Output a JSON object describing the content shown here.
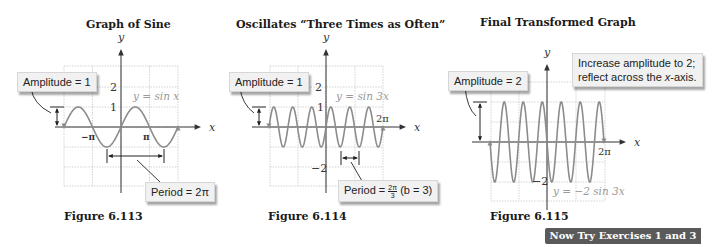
{
  "panels": [
    {
      "title": "Graph of Sine",
      "figure": "Figure 6.113",
      "equation": "y = sin x",
      "callouts": {
        "amplitude": "Amplitude = 1",
        "period_prefix": "Period = 2π"
      },
      "ticks": {
        "y_top": "2",
        "y_one": "1",
        "neg_pi": "−π",
        "pi": "π"
      },
      "axis": {
        "x": "x",
        "y": "y"
      }
    },
    {
      "title": "Oscillates “Three Times as Often”",
      "figure": "Figure 6.114",
      "equation": "y = sin 3x",
      "callouts": {
        "amplitude": "Amplitude = 1",
        "period_prefix": "Period = ",
        "period_num": "2π",
        "period_den": "3",
        "period_suffix": " (b = 3)"
      },
      "ticks": {
        "y_top": "2",
        "y_one": "1",
        "y_neg2": "−2",
        "two_pi": "2π"
      },
      "axis": {
        "x": "x",
        "y": "y"
      }
    },
    {
      "title": "Final Transformed Graph",
      "figure": "Figure 6.115",
      "equation": "y = −2 sin 3x",
      "callouts": {
        "amplitude": "Amplitude = 2",
        "note_line1": "Increase amplitude to 2;",
        "note_line2_prefix": "reflect across the ",
        "note_line2_italic": "x",
        "note_line2_suffix": "-axis."
      },
      "ticks": {
        "y_neg2": "−2",
        "two_pi": "2π"
      },
      "axis": {
        "x": "x",
        "y": "y"
      }
    }
  ],
  "badge": "Now Try Exercises 1 and 3",
  "colors": {
    "curve": "#8c8c8c",
    "grid": "#c8c8c8",
    "axis": "#333333",
    "equation": "#9a9a9a",
    "badge_bg": "#5a5a5a"
  },
  "chart_data": [
    {
      "type": "line",
      "title": "Graph of Sine",
      "function": "y = sin x",
      "x_range": [
        "-2π",
        "2π"
      ],
      "ylim": [
        -3,
        3
      ],
      "amplitude": 1,
      "period": "2π",
      "x_ticks": [
        "−π",
        "π"
      ],
      "y_ticks": [
        1,
        2
      ],
      "grid": true
    },
    {
      "type": "line",
      "title": "Oscillates “Three Times as Often”",
      "function": "y = sin 3x",
      "x_range": [
        "-2π",
        "2π"
      ],
      "ylim": [
        -3,
        3
      ],
      "amplitude": 1,
      "period": "2π/3",
      "b": 3,
      "x_ticks": [
        "2π"
      ],
      "y_ticks": [
        -2,
        1,
        2
      ],
      "grid": true
    },
    {
      "type": "line",
      "title": "Final Transformed Graph",
      "function": "y = -2 sin 3x",
      "x_range": [
        "-2π",
        "2π"
      ],
      "ylim": [
        -3,
        3
      ],
      "amplitude": 2,
      "period": "2π/3",
      "x_ticks": [
        "2π"
      ],
      "y_ticks": [
        -2
      ],
      "grid": true
    }
  ]
}
